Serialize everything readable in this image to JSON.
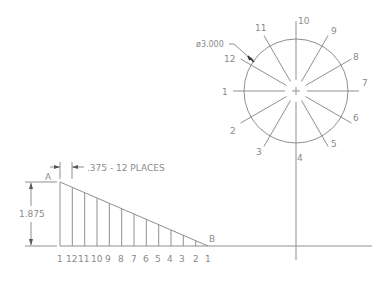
{
  "drawing": {
    "colors": {
      "line": "#8f8f8f",
      "text": "#8a8a8a",
      "background": "#ffffff"
    },
    "circle": {
      "center": [
        296,
        91
      ],
      "radius": 52,
      "diameter_callout": "ø3.000",
      "division_labels": [
        {
          "text": "10",
          "x": 300,
          "y": 24
        },
        {
          "text": "9",
          "x": 332,
          "y": 34
        },
        {
          "text": "8",
          "x": 354,
          "y": 60
        },
        {
          "text": "7",
          "x": 362,
          "y": 86
        },
        {
          "text": "6",
          "x": 354,
          "y": 121
        },
        {
          "text": "5",
          "x": 333,
          "y": 147
        },
        {
          "text": "4",
          "x": 298,
          "y": 161
        },
        {
          "text": "3",
          "x": 258,
          "y": 155
        },
        {
          "text": "2",
          "x": 231,
          "y": 133
        },
        {
          "text": "1",
          "x": 223,
          "y": 95
        },
        {
          "text": "12",
          "x": 225,
          "y": 62
        },
        {
          "text": "11",
          "x": 256,
          "y": 31
        }
      ]
    },
    "triangle": {
      "point_a_label": "A",
      "point_b_label": "B",
      "height_dimension": "1.875",
      "spacing_dimension": ".375 - 12 PLACES",
      "station_labels": [
        "1",
        "12",
        "11",
        "10",
        "9",
        "8",
        "7",
        "6",
        "5",
        "4",
        "3",
        "2",
        "1"
      ]
    }
  }
}
